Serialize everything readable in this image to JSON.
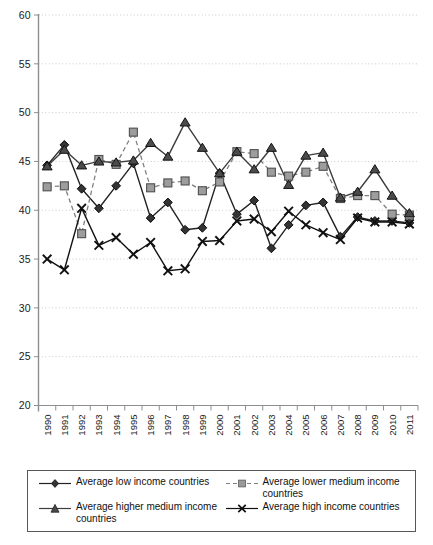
{
  "chart_data": {
    "type": "line",
    "title": "",
    "xlabel": "",
    "ylabel": "",
    "ylim": [
      20,
      60
    ],
    "ytick_step": 5,
    "yticks": [
      20,
      25,
      30,
      35,
      40,
      45,
      50,
      55,
      60
    ],
    "grid": true,
    "grid_style": "dotted-horizontal",
    "legend_position": "bottom",
    "categories": [
      "1990",
      "1991",
      "1992",
      "1993",
      "1994",
      "1995",
      "1996",
      "1997",
      "1998",
      "1999",
      "2000",
      "2001",
      "2002",
      "2003",
      "2004",
      "2005",
      "2006",
      "2007",
      "2008",
      "2009",
      "2010",
      "2011"
    ],
    "series": [
      {
        "name": "Average low income countries",
        "marker": "diamond",
        "line": "solid",
        "color": "#222222",
        "values": [
          44.6,
          46.7,
          42.2,
          40.2,
          42.5,
          44.8,
          39.2,
          40.8,
          38.0,
          38.2,
          43.8,
          39.6,
          41.0,
          36.1,
          38.5,
          40.5,
          40.8,
          37.3,
          39.3,
          38.9,
          38.9,
          38.7
        ]
      },
      {
        "name": "Average lower medium income countries",
        "marker": "square",
        "line": "dashed",
        "color": "#808080",
        "values": [
          42.4,
          42.5,
          37.6,
          45.2,
          44.7,
          48.0,
          42.3,
          42.8,
          43.0,
          42.0,
          42.9,
          46.0,
          45.8,
          43.9,
          43.5,
          43.9,
          44.5,
          41.2,
          41.5,
          41.5,
          39.6,
          39.5
        ]
      },
      {
        "name": "Average higher medium income countries",
        "marker": "triangle",
        "line": "solid",
        "color": "#3d3d3d",
        "values": [
          44.5,
          46.2,
          44.6,
          45.0,
          44.9,
          45.1,
          46.9,
          45.5,
          49.0,
          46.4,
          43.8,
          46.0,
          44.2,
          46.4,
          42.6,
          45.6,
          45.9,
          41.3,
          41.9,
          44.2,
          41.5,
          39.7
        ]
      },
      {
        "name": "Average high income countries",
        "marker": "cross",
        "line": "solid",
        "color": "#111111",
        "values": [
          35.0,
          33.9,
          40.2,
          36.4,
          37.2,
          35.5,
          36.7,
          33.8,
          34.0,
          36.8,
          36.9,
          38.9,
          39.1,
          37.8,
          39.9,
          38.5,
          37.7,
          37.0,
          39.2,
          38.8,
          38.8,
          38.6
        ]
      }
    ]
  },
  "axis": {
    "y_labels": [
      "60",
      "55",
      "50",
      "45",
      "40",
      "35",
      "30",
      "25",
      "20"
    ],
    "x_labels": [
      "1990",
      "1991",
      "1992",
      "1993",
      "1994",
      "1995",
      "1996",
      "1997",
      "1998",
      "1999",
      "2000",
      "2001",
      "2002",
      "2003",
      "2004",
      "2005",
      "2006",
      "2007",
      "2008",
      "2009",
      "2010",
      "2011"
    ]
  },
  "legend": {
    "items": [
      {
        "label": "Average low income countries",
        "marker": "diamond",
        "line": "solid"
      },
      {
        "label": "Average lower medium income countries",
        "marker": "square",
        "line": "dashed"
      },
      {
        "label": "Average higher medium income countries",
        "marker": "triangle",
        "line": "solid"
      },
      {
        "label": "Average high income countries",
        "marker": "cross",
        "line": "solid"
      }
    ]
  },
  "colors": {
    "series_low": "#222222",
    "series_lower_medium": "#808080",
    "series_higher_medium": "#3d3d3d",
    "series_high": "#111111",
    "axis": "#8b8f92",
    "grid": "#c9c9c9",
    "legend_border": "#55595c"
  }
}
